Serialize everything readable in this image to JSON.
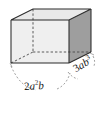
{
  "figure": {
    "shape_type": "rectangular-prism",
    "projection": "oblique",
    "background_color": "#ffffff",
    "faces": {
      "top": {
        "name": "top-face",
        "fill": "#e9e9e9"
      },
      "front": {
        "name": "front-face",
        "fill": "#efefef"
      },
      "right": {
        "name": "right-face",
        "fill": "#9e9e9e"
      }
    },
    "edges": {
      "visible_color": "#2b2b2b",
      "hidden_color": "#4a4a4a",
      "hidden_style": "dashed",
      "leader_color": "#7d7d7d",
      "leader_style": "dashed"
    },
    "labels": {
      "width": {
        "name": "width-label",
        "coefficient": "2",
        "base1": "a",
        "exponent1": "2",
        "base2": "b",
        "full_text": "2a²b",
        "position": "bottom"
      },
      "depth": {
        "name": "depth-label",
        "coefficient": "3",
        "base1": "a",
        "base2": "b",
        "exponent2": "3",
        "full_text": "3ab³",
        "position": "lower-right"
      }
    }
  }
}
